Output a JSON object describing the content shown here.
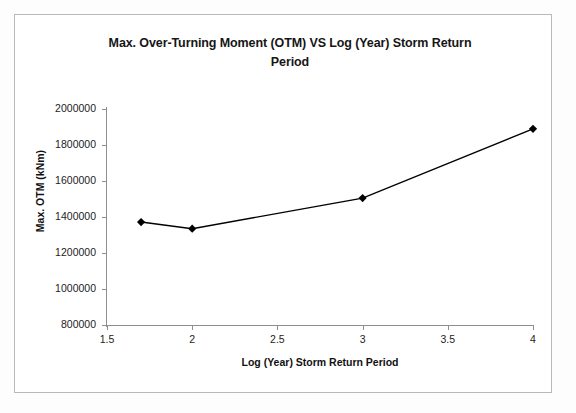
{
  "chart_data": {
    "type": "line",
    "title": "Max. Over-Turning Moment (OTM) VS Log (Year) Storm Return Period",
    "title_line1": "Max. Over-Turning Moment (OTM) VS Log (Year) Storm Return",
    "title_line2": "Period",
    "xlabel": "Log (Year) Storm Return Period",
    "ylabel": "Max. OTM (kNm)",
    "xlim": [
      1.5,
      4.0
    ],
    "ylim": [
      800000,
      2000000
    ],
    "grid": false,
    "legend": "none",
    "marker": "diamond",
    "line_color": "#000000",
    "marker_color": "#000000",
    "xticks": [
      1.5,
      2,
      2.5,
      3,
      3.5,
      4
    ],
    "xtick_labels": [
      "1.5",
      "2",
      "2.5",
      "3",
      "3.5",
      "4"
    ],
    "yticks": [
      800000,
      1000000,
      1200000,
      1400000,
      1600000,
      1800000,
      2000000
    ],
    "ytick_labels": [
      "800000",
      "1000000",
      "1200000",
      "1400000",
      "1600000",
      "1800000",
      "2000000"
    ],
    "series": [
      {
        "name": "Max. OTM",
        "x": [
          1.7,
          2.0,
          3.0,
          4.0
        ],
        "values": [
          1372000,
          1335000,
          1505000,
          1890000
        ]
      }
    ]
  }
}
